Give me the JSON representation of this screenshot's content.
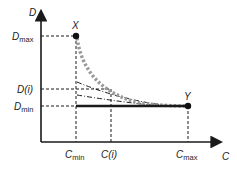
{
  "axes": {
    "y_label": "D",
    "x_label": "C"
  },
  "points": {
    "x_point": {
      "label": "X"
    },
    "y_point": {
      "label": "Y"
    }
  },
  "y_ticks": [
    {
      "main": "D",
      "sub": "max"
    },
    {
      "main": "D(i)",
      "sub": ""
    },
    {
      "main": "D",
      "sub": "min"
    }
  ],
  "x_ticks": [
    {
      "main": "C",
      "sub": "min"
    },
    {
      "main": "C(i)",
      "sub": ""
    },
    {
      "main": "C",
      "sub": "max"
    }
  ],
  "colors": {
    "axis": "#1a1a1a",
    "curve": "#9a9a9a",
    "line": "#1a1a1a"
  }
}
